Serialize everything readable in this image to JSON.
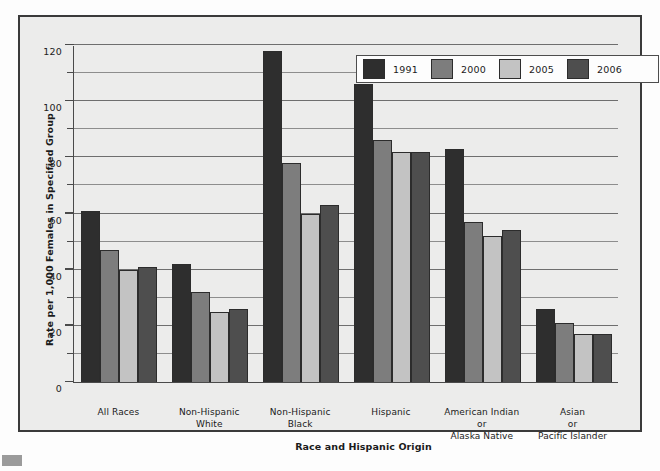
{
  "chart_data": {
    "type": "bar",
    "title": "",
    "xlabel": "Race and Hispanic Origin",
    "ylabel": "Rate per 1,000 Females in Specified Group",
    "ylim": [
      0,
      120
    ],
    "ytick_labels": [
      "0",
      "20",
      "40",
      "60",
      "80",
      "100",
      "120"
    ],
    "ytick_values": [
      0,
      20,
      40,
      60,
      80,
      100,
      120
    ],
    "minor_gridline_values": [
      10,
      30,
      50,
      70,
      90,
      110
    ],
    "grid": true,
    "legend_position": "top-right",
    "categories": [
      "All Races",
      "Non-Hispanic\nWhite",
      "Non-Hispanic\nBlack",
      "Hispanic",
      "American Indian\nor\nAlaska Native",
      "Asian\nor\nPacific Islander"
    ],
    "category_lines": [
      [
        "All Races"
      ],
      [
        "Non-Hispanic",
        "White"
      ],
      [
        "Non-Hispanic",
        "Black"
      ],
      [
        "Hispanic"
      ],
      [
        "American Indian",
        "or",
        "Alaska Native"
      ],
      [
        "Asian",
        "or",
        "Pacific Islander"
      ]
    ],
    "series": [
      {
        "name": "1991",
        "color": "#2e2e2e",
        "values": [
          61,
          42,
          118,
          106,
          83,
          26
        ]
      },
      {
        "name": "2000",
        "color": "#7d7d7d",
        "values": [
          47,
          32,
          78,
          86,
          57,
          21
        ]
      },
      {
        "name": "2005",
        "color": "#c3c3c3",
        "values": [
          40,
          25,
          60,
          82,
          52,
          17
        ]
      },
      {
        "name": "2006",
        "color": "#4e4e4e",
        "values": [
          41,
          26,
          63,
          82,
          54,
          17
        ]
      }
    ]
  },
  "legend": {
    "entries": [
      {
        "label": "1991"
      },
      {
        "label": "2000"
      },
      {
        "label": "2005"
      },
      {
        "label": "2006"
      }
    ]
  },
  "colors": {
    "frame_border": "#3a3a3a",
    "plot_background": "#ececeb",
    "axis": "#4a4a4a",
    "gridline": "#8d8d8d",
    "text": "#1b1b1b",
    "footnote_marker": "#9b9b9b"
  }
}
